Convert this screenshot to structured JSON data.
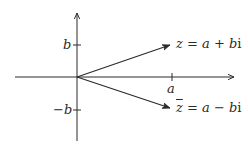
{
  "diagram": {
    "type": "complex-plane",
    "colors": {
      "stroke": "#2a2a2a",
      "background": "#ffffff"
    },
    "axes": {
      "horizontal": {
        "arrow": true
      },
      "vertical": {
        "arrow": true
      }
    },
    "ticks": {
      "a": "a",
      "b": "b",
      "neg_b": "−b"
    },
    "vectors": {
      "z": {
        "var": "z",
        "eq": " = ",
        "re": "a",
        "op": " + ",
        "im": "b",
        "unit": "i"
      },
      "z_conj": {
        "var": "z",
        "eq": " = ",
        "re": "a",
        "op": " − ",
        "im": "b",
        "unit": "i"
      }
    }
  }
}
